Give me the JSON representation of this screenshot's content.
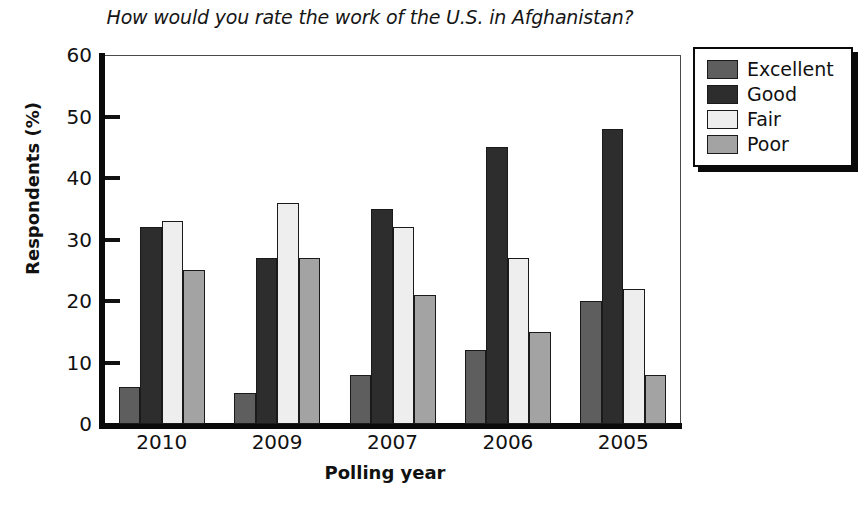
{
  "chart_data": {
    "type": "bar",
    "title": "How would you rate the work of the U.S. in Afghanistan?",
    "xlabel": "Polling year",
    "ylabel": "Respondents (%)",
    "categories": [
      "2010",
      "2009",
      "2007",
      "2006",
      "2005"
    ],
    "series": [
      {
        "name": "Excellent",
        "color": "#5e5e5e",
        "values": [
          6,
          5,
          8,
          12,
          20
        ]
      },
      {
        "name": "Good",
        "color": "#2d2d2d",
        "values": [
          32,
          27,
          35,
          45,
          48
        ]
      },
      {
        "name": "Fair",
        "color": "#eeeeee",
        "values": [
          33,
          36,
          32,
          27,
          22
        ]
      },
      {
        "name": "Poor",
        "color": "#a3a3a3",
        "values": [
          25,
          27,
          21,
          15,
          8
        ]
      }
    ],
    "ylim": [
      0,
      60
    ],
    "yticks": [
      0,
      10,
      20,
      30,
      40,
      50,
      60
    ],
    "ytick_labels": [
      "0",
      "10",
      "20",
      "30",
      "40",
      "50",
      "60"
    ],
    "grid": false,
    "legend_position": "top-right",
    "legend_entries": [
      "Excellent",
      "Good",
      "Fair",
      "Poor"
    ]
  }
}
